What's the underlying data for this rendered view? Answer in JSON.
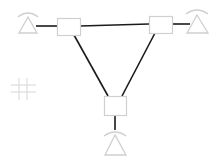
{
  "diagram": {
    "type": "network-topology-triangle",
    "nodes": [
      {
        "id": "node-left",
        "x": 57,
        "y": 18,
        "w": 23,
        "h": 17,
        "antenna": {
          "cx": 28,
          "base_y": 32
        }
      },
      {
        "id": "node-right",
        "x": 149,
        "y": 16,
        "w": 23,
        "h": 17,
        "antenna": {
          "cx": 197,
          "base_y": 33
        }
      },
      {
        "id": "node-bottom",
        "x": 104,
        "y": 96,
        "w": 22,
        "h": 19,
        "antenna": {
          "cx": 115,
          "base_y": 155
        }
      }
    ],
    "edges": [
      {
        "from": "node-left",
        "to": "node-right"
      },
      {
        "from": "node-left",
        "to": "node-bottom"
      },
      {
        "from": "node-right",
        "to": "node-bottom"
      }
    ],
    "colors": {
      "link": "#1a1a1a",
      "node_outline": "#d0d0d0",
      "antenna": "#cfcfcf",
      "hash": "#d6d6d6"
    }
  }
}
